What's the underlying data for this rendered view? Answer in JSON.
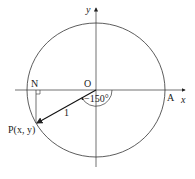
{
  "diagram": {
    "type": "unit-circle",
    "labels": {
      "y_axis": "y",
      "x_axis": "x",
      "origin": "O",
      "point_n": "N",
      "point_a": "A",
      "point_p": "P(x, y)",
      "angle": "−150°",
      "radius": "1"
    },
    "colors": {
      "stroke": "#333333",
      "background": "#ffffff"
    }
  }
}
